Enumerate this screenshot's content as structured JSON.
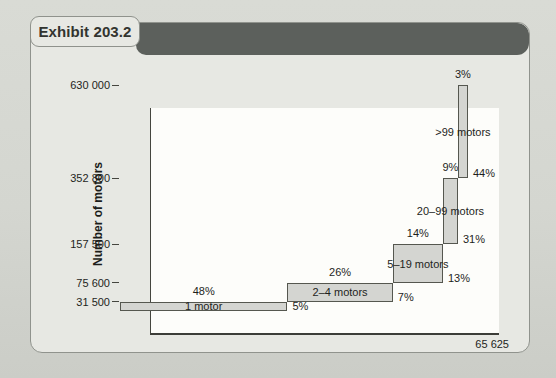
{
  "exhibit": {
    "title": "Exhibit 203.2"
  },
  "colors": {
    "page_bg": "#d4d6d0",
    "card_bg": "#e7e8e3",
    "card_border": "#90938d",
    "header_bar": "#5c605c",
    "plot_bg": "#fdfdfa",
    "bar_fill": "#d4d5d1",
    "bar_border": "#55574f",
    "axis": "#45463f",
    "text": "#1e1f1c"
  },
  "chart_data": {
    "type": "bar",
    "subtype": "variable-width cumulative step chart",
    "title": "Exhibit 203.2",
    "xlabel": "Number of orders",
    "ylabel": "Number of motors",
    "x_axis_total": {
      "value": 65625,
      "label": "65 625"
    },
    "ylim": [
      0,
      630000
    ],
    "grid": false,
    "y_ticks": [
      {
        "value": 31500,
        "label": "31 500"
      },
      {
        "value": 75600,
        "label": "75 600"
      },
      {
        "value": 157500,
        "label": "157 500"
      },
      {
        "value": 352800,
        "label": "352 800"
      },
      {
        "value": 630000,
        "label": "630 000"
      }
    ],
    "segments": [
      {
        "name": "1 motor",
        "orders_pct": "48%",
        "motors_pct": "5%",
        "cum_motors": 31500
      },
      {
        "name": "2–4 motors",
        "orders_pct": "26%",
        "motors_pct": "7%",
        "cum_motors": 75600
      },
      {
        "name": "5–19 motors",
        "orders_pct": "14%",
        "motors_pct": "13%",
        "cum_motors": 157500
      },
      {
        "name": "20–99 motors",
        "orders_pct": "9%",
        "motors_pct": "31%",
        "cum_motors": 352800
      },
      {
        "name": ">99 motors",
        "orders_pct": "3%",
        "motors_pct": "44%",
        "cum_motors": 630000
      }
    ],
    "layout": {
      "note": "as-drawn cumulative fractions of plot width/height",
      "x_cum_frac": [
        0,
        0.481,
        0.784,
        0.928,
        0.971,
        1.0
      ],
      "y_cum_frac": [
        0,
        0.04,
        0.124,
        0.296,
        0.588,
        1.0
      ]
    }
  }
}
